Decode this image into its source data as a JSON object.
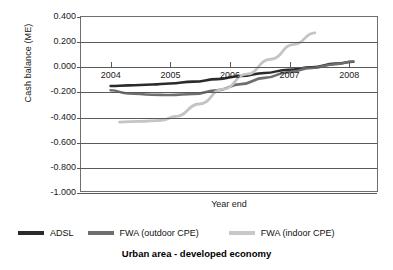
{
  "chart_data": {
    "type": "line",
    "title": "Urban area - developed economy",
    "xlabel": "Year end",
    "ylabel": "Cash balance (M€)",
    "ylabel_rendered": "Cash balance (ME)",
    "x_tick_labels": [
      "2004",
      "2005",
      "2006",
      "2007",
      "2008"
    ],
    "x": [
      2004,
      2005,
      2006,
      2007,
      2008
    ],
    "xlim": [
      2003.5,
      2008.5
    ],
    "ylim": [
      -1.0,
      0.4
    ],
    "y_tick_labels": [
      "0.400",
      "0.200",
      "0.000",
      "-0.200",
      "-0.400",
      "-0.600",
      "-0.800",
      "-1.000"
    ],
    "y_ticks": [
      0.4,
      0.2,
      0.0,
      -0.2,
      -0.4,
      -0.6,
      -0.8,
      -1.0
    ],
    "grid": true,
    "legend_position": "bottom",
    "series": [
      {
        "name": "ADSL",
        "color": "#2b2b2b",
        "x": [
          2004.0,
          2004.3,
          2004.7,
          2005.0,
          2005.4,
          2005.8,
          2006.2,
          2006.6,
          2007.0,
          2007.4,
          2007.8,
          2008.1
        ],
        "values": [
          -0.155,
          -0.15,
          -0.143,
          -0.135,
          -0.12,
          -0.1,
          -0.075,
          -0.05,
          -0.025,
          -0.005,
          0.025,
          0.04
        ]
      },
      {
        "name": "FWA (outdoor CPE)",
        "color": "#6e6e6e",
        "x": [
          2004.0,
          2004.3,
          2004.7,
          2005.0,
          2005.4,
          2005.8,
          2006.2,
          2006.6,
          2007.0,
          2007.4,
          2007.8,
          2008.1
        ],
        "values": [
          -0.19,
          -0.215,
          -0.225,
          -0.228,
          -0.22,
          -0.19,
          -0.14,
          -0.09,
          -0.045,
          -0.01,
          0.02,
          0.042
        ]
      },
      {
        "name": "FWA (indoor CPE)",
        "color": "#c4c4c4",
        "x": [
          2004.15,
          2004.5,
          2004.85,
          2005.1,
          2005.5,
          2005.9,
          2006.3,
          2006.7,
          2007.1,
          2007.45
        ],
        "values": [
          -0.445,
          -0.44,
          -0.432,
          -0.4,
          -0.3,
          -0.18,
          -0.06,
          0.06,
          0.18,
          0.272
        ]
      }
    ]
  },
  "legend": {
    "items": [
      {
        "label": "ADSL",
        "color": "#2b2b2b"
      },
      {
        "label": "FWA (outdoor CPE)",
        "color": "#6e6e6e"
      },
      {
        "label": "FWA (indoor CPE)",
        "color": "#c8c8c8"
      }
    ]
  }
}
